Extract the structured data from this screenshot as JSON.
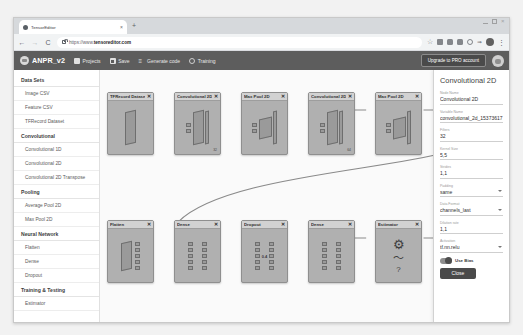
{
  "browser": {
    "tab": {
      "title": "TensorEditor",
      "close_label": "×"
    },
    "new_tab_label": "+",
    "nav": {
      "back": "←",
      "forward": "→",
      "reload": "C"
    },
    "url_prefix": "https://www.",
    "url_domain": "tensoreditor.com",
    "star_icon": "☆",
    "kebab_label": "⋮",
    "window_close": "×"
  },
  "toolbar": {
    "brand": "ANPR_v2",
    "items": [
      {
        "label": "Projects",
        "icon": "projects-icon"
      },
      {
        "label": "Save",
        "icon": "save-icon"
      },
      {
        "label": "Generate code",
        "icon": "code-icon"
      },
      {
        "label": "Training",
        "icon": "training-icon"
      }
    ],
    "upgrade_label": "Upgrade to PRO account"
  },
  "sidebar": {
    "sections": [
      {
        "heading": "Data Sets",
        "items": [
          "Image CSV",
          "Feature CSV",
          "TFRecord Dataset"
        ]
      },
      {
        "heading": "Convolutional",
        "items": [
          "Convolutional 1D",
          "Convolutional 2D",
          "Convolutional 2D Transpose"
        ]
      },
      {
        "heading": "Pooling",
        "items": [
          "Average Pool 2D",
          "Max Pool 2D"
        ]
      },
      {
        "heading": "Neural Network",
        "items": [
          "Flatten",
          "Dense",
          "Dropout"
        ]
      },
      {
        "heading": "Training & Testing",
        "items": [
          "Estimator"
        ]
      }
    ]
  },
  "canvas": {
    "nodes": [
      {
        "id": "n1",
        "title": "TFRecord Dataset",
        "glyph": "slab",
        "close": "✕",
        "sublabel": ""
      },
      {
        "id": "n2",
        "title": "Convolutional 2D",
        "glyph": "conv",
        "close": "✕",
        "sublabel": "32"
      },
      {
        "id": "n3",
        "title": "Max Pool 2D",
        "glyph": "pool",
        "close": "✕",
        "sublabel": ""
      },
      {
        "id": "n4",
        "title": "Convolutional 2D",
        "glyph": "conv",
        "close": "✕",
        "sublabel": "64"
      },
      {
        "id": "n5",
        "title": "Max Pool 2D",
        "glyph": "pool",
        "close": "✕",
        "sublabel": ""
      },
      {
        "id": "n6",
        "title": "Flatten",
        "glyph": "flatten",
        "close": "✕",
        "sublabel": ""
      },
      {
        "id": "n7",
        "title": "Dense",
        "glyph": "dense",
        "close": "✕",
        "sublabel": ""
      },
      {
        "id": "n8",
        "title": "Dropout",
        "glyph": "dropout",
        "close": "✕",
        "midlabel": "0.4"
      },
      {
        "id": "n9",
        "title": "Dense",
        "glyph": "dense",
        "close": "✕",
        "sublabel": ""
      },
      {
        "id": "n10",
        "title": "Estimator",
        "glyph": "estimator",
        "close": "✕",
        "sublabel": ""
      }
    ],
    "estimator_icons": {
      "gear": "⚙",
      "chart": "〜",
      "question": "?"
    }
  },
  "properties": {
    "title": "Convolutional 2D",
    "fields": [
      {
        "label": "Node Name",
        "value": "Convolutional 2D",
        "type": "text"
      },
      {
        "label": "Variable Name",
        "value": "convolutional_2d_15373617",
        "type": "text"
      },
      {
        "label": "Filters",
        "value": "32",
        "type": "text"
      },
      {
        "label": "Kernel Size",
        "value": "5,5",
        "type": "text"
      },
      {
        "label": "Strides",
        "value": "1,1",
        "type": "text"
      },
      {
        "label": "Padding",
        "value": "same",
        "type": "select"
      },
      {
        "label": "Data Format",
        "value": "channels_last",
        "type": "select"
      },
      {
        "label": "Dilation rate",
        "value": "1,1",
        "type": "text"
      },
      {
        "label": "Activation",
        "value": "tf.nn.relu",
        "type": "select"
      }
    ],
    "use_bias_label": "Use Bias",
    "close_label": "Close"
  },
  "colors": {
    "toolbar_bg": "#5d5d5d",
    "node_bg": "#b0b0b0",
    "node_head_bg": "#d2d2d2",
    "canvas_bg": "#fafafa",
    "accent_button": "#4a4a4a"
  }
}
